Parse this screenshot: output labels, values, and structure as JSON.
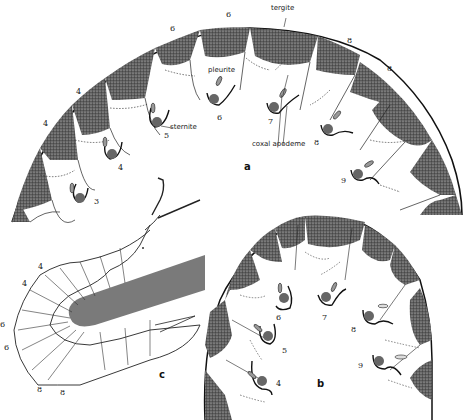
{
  "figure": {
    "panels": [
      {
        "id": "a",
        "label": "a",
        "terms": {
          "tergite": "tergite",
          "pleurite": "pleurite",
          "sternite": "sternite",
          "coxal_apodeme": "coxal apodeme"
        },
        "tergite_numbers": [
          "4",
          "4",
          "6",
          "6",
          "8",
          "8"
        ],
        "leg_numbers": [
          "3",
          "4",
          "5",
          "6",
          "7",
          "8",
          "9"
        ]
      },
      {
        "id": "b",
        "label": "b",
        "leg_numbers": [
          "4",
          "5",
          "6",
          "7",
          "8",
          "9"
        ]
      },
      {
        "id": "c",
        "label": "c",
        "segment_numbers": [
          "4",
          "4",
          "6",
          "6",
          "8",
          "8"
        ]
      }
    ],
    "colors": {
      "stipple_dark": "#3a3a3a",
      "stipple_mid": "#6b6b6b",
      "gut_gray": "#7a7a7a",
      "coxa_gray": "#666666",
      "ink": "#1a1a1a",
      "background": "#ffffff"
    }
  }
}
